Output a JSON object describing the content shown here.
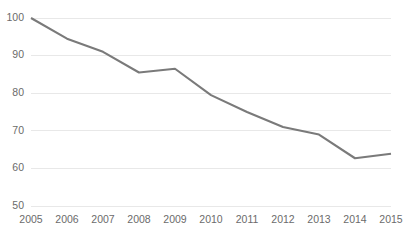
{
  "chart_data": {
    "type": "line",
    "title": "",
    "subtitle": "",
    "xlabel": "",
    "ylabel": "",
    "categories": [
      "2005",
      "2006",
      "2007",
      "2008",
      "2009",
      "2010",
      "2011",
      "2012",
      "2013",
      "2014",
      "2015"
    ],
    "x": [
      2005,
      2006,
      2007,
      2008,
      2009,
      2010,
      2011,
      2012,
      2013,
      2014,
      2015
    ],
    "values": [
      100,
      94.5,
      91,
      85.5,
      86.5,
      79.5,
      75,
      71,
      69,
      62.7,
      63.9
    ],
    "series": [
      {
        "name": "",
        "values": [
          100,
          94.5,
          91,
          85.5,
          86.5,
          79.5,
          75,
          71,
          69,
          62.7,
          63.9
        ]
      }
    ],
    "ylim": [
      50,
      100
    ],
    "xlim": [
      2005,
      2015
    ],
    "yticks": [
      50,
      60,
      70,
      80,
      90,
      100
    ],
    "ytick_labels": [
      "50",
      "60",
      "70",
      "80",
      "90",
      "100"
    ],
    "xtick_labels": [
      "2005",
      "2006",
      "2007",
      "2008",
      "2009",
      "2010",
      "2011",
      "2012",
      "2013",
      "2014",
      "2015"
    ],
    "grid": true,
    "grid_axis": "y",
    "legend": false,
    "legend_position": "none",
    "annotations": [],
    "colors": {
      "line": "#7a7a7a",
      "grid": "#e8e8e8",
      "text": "#6b6b6b",
      "background": "#ffffff"
    },
    "markers": false
  }
}
